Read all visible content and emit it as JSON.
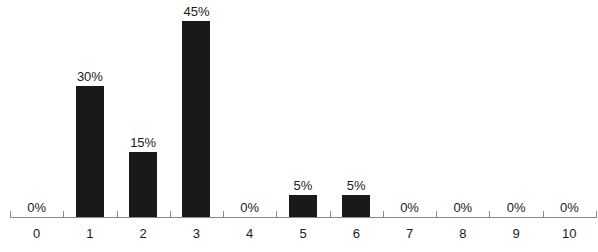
{
  "chart_data": {
    "type": "bar",
    "title": "",
    "subtitle": "",
    "xlabel": "",
    "ylabel": "",
    "categories": [
      "0",
      "1",
      "2",
      "3",
      "4",
      "5",
      "6",
      "7",
      "8",
      "9",
      "10"
    ],
    "values": [
      0,
      30,
      15,
      45,
      0,
      5,
      5,
      0,
      0,
      0,
      0
    ],
    "data_labels": [
      "0%",
      "30%",
      "15%",
      "45%",
      "0%",
      "5%",
      "5%",
      "0%",
      "0%",
      "0%",
      "0%"
    ],
    "ylim": [
      0,
      50
    ],
    "grid": false,
    "legend": null,
    "legend_position": "none",
    "y_axis_visible": false,
    "x_axis_visible": true,
    "bar_color": "#191919",
    "axis_color": "#8a8a8a",
    "label_color": "#1b1b1b",
    "background_color": "#ffffff",
    "units": "percent",
    "annotations": []
  }
}
